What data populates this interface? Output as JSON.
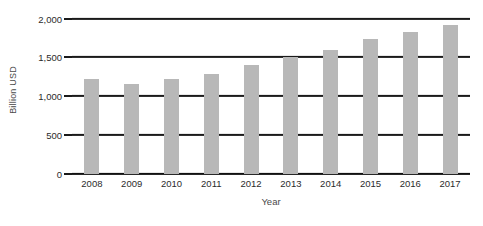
{
  "chart_data": {
    "type": "bar",
    "title": "",
    "subtitle": "",
    "xlabel": "Year",
    "ylabel": "Billion USD",
    "categories": [
      "2008",
      "2009",
      "2010",
      "2011",
      "2012",
      "2013",
      "2014",
      "2015",
      "2016",
      "2017"
    ],
    "values": [
      1220,
      1160,
      1220,
      1280,
      1400,
      1500,
      1600,
      1740,
      1820,
      1920
    ],
    "series": [
      {
        "name": "Billion USD",
        "values": [
          1220,
          1160,
          1220,
          1280,
          1400,
          1500,
          1600,
          1740,
          1820,
          1920
        ]
      }
    ],
    "ylim": [
      0,
      2000
    ],
    "ytick_values": [
      0,
      500,
      1000,
      1500,
      2000
    ],
    "ytick_labels": [
      "0",
      "500",
      "1,000",
      "1,500",
      "2,000"
    ],
    "grid": true,
    "grid_axis": "y",
    "legend": false,
    "legend_position": "none",
    "bar_color": "#b8b8b8",
    "axis_color": "#1a1a1a",
    "gridline_color": "#1a1a1a",
    "label_color": "#2b2b2b",
    "background_color": "#ffffff",
    "annotations": []
  }
}
